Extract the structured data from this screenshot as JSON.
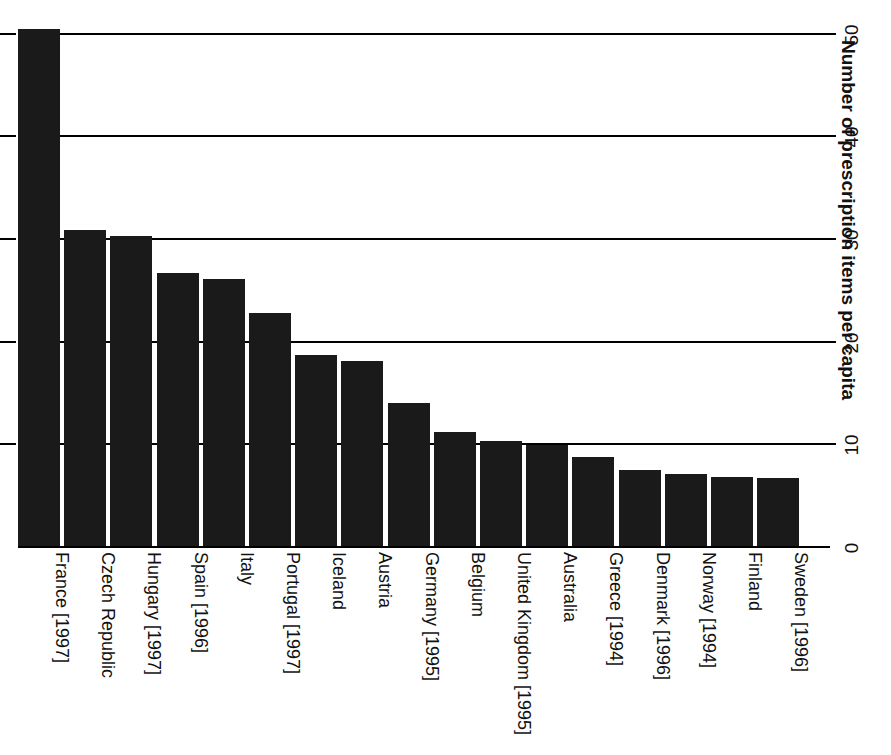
{
  "chart_data": {
    "type": "bar",
    "title": "",
    "subtitle": "",
    "xlabel": "",
    "ylabel": "Number of prescription items per capita",
    "ylim": [
      0,
      52
    ],
    "yticks": [
      0,
      10,
      20,
      30,
      40,
      50
    ],
    "ytick_labels": [
      "0",
      "10",
      "20",
      "30",
      "40",
      "50"
    ],
    "grid": true,
    "grid_axis": "y",
    "legend": false,
    "orientation": "vertical",
    "bar_color": "#1a1a1a",
    "categories": [
      "France [1997]",
      "Czech Republic",
      "Hungary [1997]",
      "Spain [1996]",
      "Italy",
      "Portugal [1997]",
      "Iceland",
      "Austria",
      "Germany [1995]",
      "Belgium",
      "United Kingdom [1995]",
      "Australia",
      "Greece [1994]",
      "Denmark [1996]",
      "Norway [1994]",
      "Finland",
      "Sweden [1996]"
    ],
    "values": [
      50.5,
      31.0,
      30.4,
      26.8,
      26.2,
      22.9,
      18.8,
      18.2,
      14.1,
      11.3,
      10.4,
      10.0,
      8.9,
      7.6,
      7.2,
      6.9,
      6.8
    ]
  },
  "axis": {
    "value_axis_title": "Number of prescription items per capita",
    "ticks": [
      {
        "label": "0",
        "value": 0
      },
      {
        "label": "10",
        "value": 10
      },
      {
        "label": "20",
        "value": 20
      },
      {
        "label": "30",
        "value": 30
      },
      {
        "label": "40",
        "value": 40
      },
      {
        "label": "50",
        "value": 50
      }
    ]
  }
}
